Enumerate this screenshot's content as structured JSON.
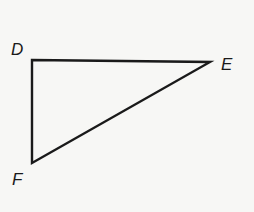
{
  "diagram": {
    "type": "triangle",
    "background": "#f7f7f5",
    "stroke_color": "#1a1a1a",
    "vertices": {
      "D": {
        "label": "D",
        "x": 32,
        "y": 60
      },
      "E": {
        "label": "E",
        "x": 210,
        "y": 62
      },
      "F": {
        "label": "F",
        "x": 32,
        "y": 163
      }
    },
    "segments": [
      "DE",
      "EF",
      "FD"
    ],
    "right_angle_at": "D"
  }
}
